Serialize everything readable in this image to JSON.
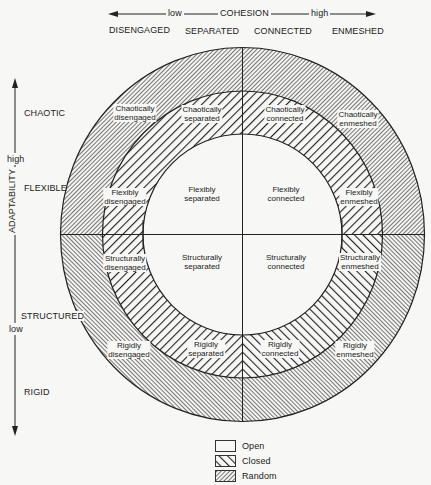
{
  "cohesion_axis": {
    "title": "COHESION",
    "low": "low",
    "high": "high",
    "levels": [
      "DISENGAGED",
      "SEPARATED",
      "CONNECTED",
      "ENMESHED"
    ]
  },
  "adaptability_axis": {
    "title": "ADAPTABILITY",
    "high": "high",
    "low": "low",
    "levels": [
      "CHAOTIC",
      "FLEXIBLE",
      "STRUCTURED",
      "RIGID"
    ]
  },
  "cells": [
    {
      "id": "chaotically-disengaged",
      "line1": "Chaotically",
      "line2": "disengaged"
    },
    {
      "id": "chaotically-separated",
      "line1": "Chaotically",
      "line2": "separated"
    },
    {
      "id": "chaotically-connected",
      "line1": "Chaotically",
      "line2": "connected"
    },
    {
      "id": "chaotically-enmeshed",
      "line1": "Chaotically",
      "line2": "enmeshed"
    },
    {
      "id": "flexibly-disengaged",
      "line1": "Flexibly",
      "line2": "disengaged"
    },
    {
      "id": "flexibly-separated",
      "line1": "Flexibly",
      "line2": "separated"
    },
    {
      "id": "flexibly-connected",
      "line1": "Flexibly",
      "line2": "connected"
    },
    {
      "id": "flexibly-enmeshed",
      "line1": "Flexibly",
      "line2": "enmeshed"
    },
    {
      "id": "structurally-disengaged",
      "line1": "Structurally",
      "line2": "disengaged"
    },
    {
      "id": "structurally-separated",
      "line1": "Structurally",
      "line2": "separated"
    },
    {
      "id": "structurally-connected",
      "line1": "Structurally",
      "line2": "connected"
    },
    {
      "id": "structurally-enmeshed",
      "line1": "Structurally",
      "line2": "enmeshed"
    },
    {
      "id": "rigidly-disengaged",
      "line1": "Rigidly",
      "line2": "disengaged"
    },
    {
      "id": "rigidly-separated",
      "line1": "Rigidly",
      "line2": "separated"
    },
    {
      "id": "rigidly-connected",
      "line1": "Rigidly",
      "line2": "connected"
    },
    {
      "id": "rigidly-enmeshed",
      "line1": "Rigidly",
      "line2": "enmeshed"
    }
  ],
  "legend": [
    {
      "label": "Open",
      "pattern": "none"
    },
    {
      "label": "Closed",
      "pattern": "wide-hatch"
    },
    {
      "label": "Random",
      "pattern": "fine-hatch"
    }
  ],
  "colors": {
    "ink": "#222222",
    "background": "#f7f7f5"
  }
}
